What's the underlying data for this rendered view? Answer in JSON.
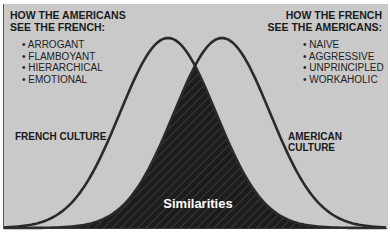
{
  "left_panel": {
    "heading_line1": "HOW THE AMERICANS",
    "heading_line2": "SEE THE FRENCH:",
    "items": [
      "ARROGANT",
      "FLAMBOYANT",
      "HIERARCHICAL",
      "EMOTIONAL"
    ]
  },
  "right_panel": {
    "heading_line1": "HOW THE FRENCH",
    "heading_line2": "SEE THE AMERICANS:",
    "items": [
      "NAIVE",
      "AGGRESSIVE",
      "UNPRINCIPLED",
      "WORKAHOLIC"
    ]
  },
  "curves": {
    "left_label": "FRENCH CULTURE",
    "right_label": "AMERICAN CULTURE",
    "overlap_label": "Similarities"
  },
  "colors": {
    "background": "#c9c9c9",
    "curve": "#2a2a2a",
    "overlap_fill": "#1c1c1c",
    "overlap_label": "#ffffff"
  }
}
